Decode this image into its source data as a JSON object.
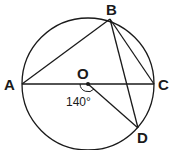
{
  "diagram": {
    "type": "circle-geometry",
    "center": {
      "label": "O",
      "x": 88,
      "y": 84
    },
    "radius": 66,
    "points": [
      {
        "label": "A",
        "x": 22,
        "y": 84
      },
      {
        "label": "B",
        "x": 110,
        "y": 19
      },
      {
        "label": "C",
        "x": 154,
        "y": 84
      },
      {
        "label": "D",
        "x": 138,
        "y": 128
      }
    ],
    "segments": [
      "AC",
      "AB",
      "BC",
      "BD",
      "OD"
    ],
    "angle": {
      "at": "O",
      "from": "A",
      "to": "D",
      "value": "140°"
    }
  },
  "labels": {
    "A": "A",
    "B": "B",
    "C": "C",
    "D": "D",
    "O": "O",
    "angle": "140°"
  }
}
